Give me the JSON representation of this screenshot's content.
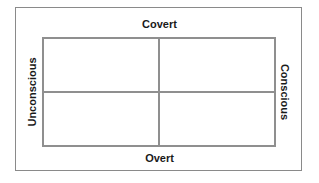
{
  "diagram": {
    "type": "2x2 quadrant matrix",
    "labels": {
      "top": "Covert",
      "bottom": "Overt",
      "left": "Unconscious",
      "right": "Conscious"
    },
    "quadrants": [
      {
        "position": "top-left",
        "text": ""
      },
      {
        "position": "top-right",
        "text": ""
      },
      {
        "position": "bottom-left",
        "text": ""
      },
      {
        "position": "bottom-right",
        "text": ""
      }
    ],
    "colors": {
      "border": "#8f8f8f",
      "text": "#1a1a1a",
      "background": "#ffffff"
    }
  }
}
